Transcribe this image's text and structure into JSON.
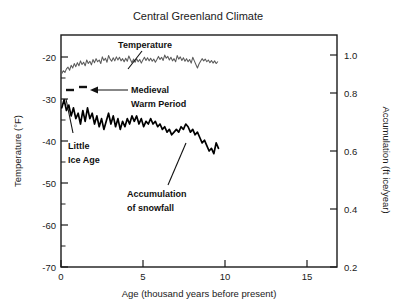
{
  "chart_data": {
    "type": "line",
    "title": "Central Greenland Climate",
    "xlabel": "Age (thousand years before present)",
    "ylabel": "Temperature (°F)",
    "y2label": "Accumulation (ft ice/year)",
    "xlim": [
      0,
      17.7
    ],
    "ylim": [
      -70,
      -18
    ],
    "y2lim": [
      0.2,
      1.06
    ],
    "grid": false,
    "legend": "none",
    "xticks": [
      0,
      5,
      10,
      15
    ],
    "xticklabels": [
      "0",
      "5",
      "10",
      "15"
    ],
    "yticks": [
      -20,
      -30,
      -40,
      -50,
      -60,
      -70
    ],
    "yticklabels": [
      "-20",
      "-30",
      "-40",
      "-50",
      "-60",
      "-70"
    ],
    "y2ticks": [
      0.2,
      0.4,
      0.6,
      0.8,
      1.0
    ],
    "y2ticklabels": [
      "0.2",
      "0.4",
      "0.6",
      "0.8",
      "1.0"
    ],
    "series": [
      {
        "name": "Temperature",
        "axis": "left",
        "color": "#5a5a5a",
        "units": "°F",
        "x": [
          0.05,
          0.15,
          0.25,
          0.35,
          0.45,
          0.55,
          0.65,
          0.75,
          0.85,
          0.95,
          1.05,
          1.15,
          1.25,
          1.35,
          1.45,
          1.55,
          1.65,
          1.75,
          1.85,
          1.95,
          2.05,
          2.15,
          2.25,
          2.35,
          2.45,
          2.55,
          2.65,
          2.75,
          2.85,
          2.95,
          3.05,
          3.15,
          3.25,
          3.35,
          3.45,
          3.55,
          3.65,
          3.75,
          3.85,
          3.95,
          4.05,
          4.15,
          4.25,
          4.35,
          4.45,
          4.55,
          4.65,
          4.75,
          4.85,
          4.95,
          5.05,
          5.15,
          5.25,
          5.35,
          5.45,
          5.55,
          5.65,
          5.75,
          5.85,
          5.95,
          6.05,
          6.15,
          6.25,
          6.35,
          6.45,
          6.55,
          6.65,
          6.75,
          6.85,
          6.95,
          7.05,
          7.15,
          7.25,
          7.35,
          7.45,
          7.55,
          7.65,
          7.75,
          7.85,
          7.95,
          8.05,
          8.15,
          8.25,
          8.35,
          8.45,
          8.55,
          8.65,
          8.75,
          8.85,
          8.95,
          9.05,
          9.15,
          9.25,
          9.35,
          9.45,
          9.55,
          9.65,
          9.75,
          9.85,
          9.95,
          10.05
        ],
        "y": [
          -26.6,
          -26.0,
          -26.4,
          -25.6,
          -25.2,
          -25.9,
          -24.8,
          -25.4,
          -24.4,
          -25.1,
          -24.2,
          -24.9,
          -23.8,
          -24.6,
          -24.1,
          -24.9,
          -23.6,
          -24.4,
          -23.9,
          -24.7,
          -23.5,
          -24.2,
          -23.3,
          -24.0,
          -23.6,
          -24.4,
          -22.9,
          -23.7,
          -23.2,
          -24.1,
          -22.6,
          -23.4,
          -23.9,
          -23.1,
          -23.8,
          -22.9,
          -23.6,
          -23.0,
          -23.8,
          -23.3,
          -24.0,
          -23.2,
          -23.9,
          -22.7,
          -23.5,
          -24.2,
          -23.4,
          -24.1,
          -23.3,
          -24.0,
          -23.5,
          -24.3,
          -23.6,
          -23.0,
          -23.7,
          -23.1,
          -23.8,
          -23.2,
          -23.9,
          -23.4,
          -24.1,
          -23.5,
          -22.8,
          -23.5,
          -23.0,
          -23.7,
          -22.5,
          -23.2,
          -22.8,
          -23.6,
          -23.0,
          -23.8,
          -23.3,
          -24.0,
          -22.6,
          -23.4,
          -22.9,
          -23.7,
          -23.1,
          -23.9,
          -23.3,
          -24.0,
          -23.5,
          -24.3,
          -23.0,
          -23.8,
          -24.6,
          -25.4,
          -24.5,
          -23.9,
          -23.3,
          -23.8,
          -23.4,
          -24.0,
          -23.6,
          -24.2,
          -23.7,
          -24.3,
          -23.8,
          -24.4,
          -24.0
        ]
      },
      {
        "name": "Accumulation of snowfall",
        "axis": "right",
        "color": "#000000",
        "units": "ft ice/year",
        "x": [
          0.05,
          0.2,
          0.35,
          0.5,
          0.65,
          0.8,
          0.95,
          1.1,
          1.25,
          1.4,
          1.55,
          1.7,
          1.85,
          2.0,
          2.15,
          2.3,
          2.45,
          2.6,
          2.75,
          2.9,
          3.05,
          3.2,
          3.35,
          3.5,
          3.65,
          3.8,
          3.95,
          4.1,
          4.25,
          4.4,
          4.55,
          4.7,
          4.85,
          5.0,
          5.15,
          5.3,
          5.45,
          5.6,
          5.75,
          5.9,
          6.05,
          6.2,
          6.35,
          6.5,
          6.65,
          6.8,
          6.95,
          7.1,
          7.25,
          7.4,
          7.55,
          7.7,
          7.85,
          8.0,
          8.15,
          8.3,
          8.45,
          8.6,
          8.75,
          8.9,
          9.05,
          9.2,
          9.35,
          9.5,
          9.65,
          9.8,
          9.95,
          10.1
        ],
        "y": [
          0.79,
          0.82,
          0.78,
          0.8,
          0.76,
          0.79,
          0.75,
          0.77,
          0.73,
          0.78,
          0.74,
          0.79,
          0.75,
          0.77,
          0.73,
          0.76,
          0.72,
          0.75,
          0.71,
          0.74,
          0.77,
          0.73,
          0.76,
          0.72,
          0.75,
          0.71,
          0.74,
          0.72,
          0.75,
          0.73,
          0.76,
          0.74,
          0.76,
          0.73,
          0.75,
          0.72,
          0.74,
          0.73,
          0.75,
          0.73,
          0.74,
          0.72,
          0.73,
          0.71,
          0.72,
          0.7,
          0.71,
          0.69,
          0.7,
          0.71,
          0.7,
          0.72,
          0.71,
          0.73,
          0.72,
          0.7,
          0.71,
          0.69,
          0.7,
          0.68,
          0.66,
          0.67,
          0.65,
          0.63,
          0.64,
          0.62,
          0.66,
          0.64
        ]
      }
    ],
    "annotations": [
      {
        "id": "temperature-label",
        "text": "Temperature",
        "x_px": 145,
        "y_px": 48
      },
      {
        "id": "medieval-warm-period-label",
        "text_line1": "Medieval",
        "text_line2": "Warm Period",
        "x_px": 106,
        "y_px": 92
      },
      {
        "id": "little-ice-age-label",
        "text_line1": "Little",
        "text_line2": "Ice Age",
        "x_px": 72,
        "y_px": 145
      },
      {
        "id": "accumulation-of-snowfall-label",
        "text_line1": "Accumulation",
        "text_line2": "of snowfall",
        "x_px": 130,
        "y_px": 196
      }
    ]
  }
}
